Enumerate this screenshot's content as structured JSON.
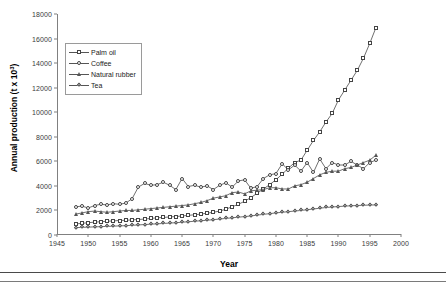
{
  "chart_data": {
    "type": "line",
    "title": "",
    "xlabel": "Year",
    "ylabel": "Annual production (t x 10",
    "ylabel_exponent": "3",
    "ylabel_suffix": ")",
    "xlim": [
      1945,
      2000
    ],
    "ylim": [
      0,
      18000
    ],
    "xticks": [
      1945,
      1950,
      1955,
      1960,
      1965,
      1970,
      1975,
      1980,
      1985,
      1990,
      1995,
      2000
    ],
    "yticks": [
      0,
      2000,
      4000,
      6000,
      8000,
      10000,
      12000,
      14000,
      16000,
      18000
    ],
    "grid": false,
    "legend_position": "upper-left-inside",
    "x": [
      1948,
      1949,
      1950,
      1951,
      1952,
      1953,
      1954,
      1955,
      1956,
      1957,
      1958,
      1959,
      1960,
      1961,
      1962,
      1963,
      1964,
      1965,
      1966,
      1967,
      1968,
      1969,
      1970,
      1971,
      1972,
      1973,
      1974,
      1975,
      1976,
      1977,
      1978,
      1979,
      1980,
      1981,
      1982,
      1983,
      1984,
      1985,
      1986,
      1987,
      1988,
      1989,
      1990,
      1991,
      1992,
      1993,
      1994,
      1995,
      1996
    ],
    "series": [
      {
        "name": "Palm oil",
        "marker": "square",
        "values": [
          900,
          950,
          1000,
          1050,
          1080,
          1120,
          1150,
          1180,
          1200,
          1230,
          1260,
          1300,
          1350,
          1400,
          1430,
          1470,
          1500,
          1550,
          1600,
          1650,
          1700,
          1780,
          1850,
          1950,
          2100,
          2300,
          2500,
          2750,
          3050,
          3400,
          3750,
          4100,
          4500,
          4950,
          5450,
          5900,
          6100,
          6900,
          7700,
          8400,
          9200,
          9900,
          11000,
          11800,
          12600,
          13400,
          14400,
          15600,
          16900
        ],
        "color": "#4a4a4a"
      },
      {
        "name": "Coffee",
        "marker": "circle",
        "values": [
          2300,
          2350,
          2200,
          2400,
          2500,
          2450,
          2550,
          2500,
          2600,
          2950,
          3900,
          4200,
          4050,
          4100,
          4300,
          4050,
          3700,
          4600,
          3950,
          4050,
          3900,
          4000,
          3700,
          4050,
          4250,
          3900,
          4400,
          4500,
          3800,
          3950,
          4600,
          4900,
          5000,
          5800,
          5300,
          5700,
          5200,
          5900,
          5100,
          6200,
          5400,
          5900,
          5700,
          5700,
          6000,
          5700,
          5400,
          5900,
          6100
        ],
        "color": "#4a4a4a"
      },
      {
        "name": "Natural rubber",
        "marker": "triangle",
        "values": [
          1700,
          1800,
          1900,
          1950,
          1900,
          1850,
          1900,
          1950,
          2000,
          2000,
          2050,
          2100,
          2150,
          2200,
          2250,
          2300,
          2350,
          2400,
          2450,
          2550,
          2650,
          2800,
          3000,
          3100,
          3200,
          3450,
          3500,
          3350,
          3600,
          3650,
          3700,
          3850,
          3850,
          3750,
          3750,
          4000,
          4100,
          4300,
          4600,
          4900,
          5100,
          5200,
          5200,
          5400,
          5500,
          5700,
          5900,
          6100,
          6500
        ],
        "color": "#4a4a4a"
      },
      {
        "name": "Tea",
        "marker": "diamond",
        "values": [
          600,
          620,
          640,
          660,
          680,
          700,
          720,
          740,
          760,
          790,
          820,
          850,
          880,
          910,
          940,
          970,
          1000,
          1040,
          1080,
          1120,
          1160,
          1200,
          1250,
          1300,
          1350,
          1400,
          1450,
          1500,
          1550,
          1620,
          1680,
          1740,
          1800,
          1850,
          1900,
          1950,
          2000,
          2060,
          2120,
          2180,
          2240,
          2280,
          2320,
          2350,
          2380,
          2400,
          2420,
          2440,
          2450
        ],
        "color": "#4a4a4a"
      }
    ]
  }
}
